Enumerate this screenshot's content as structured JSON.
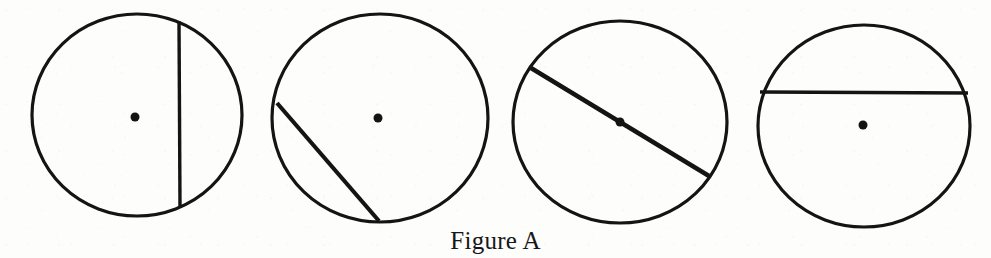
{
  "figure": {
    "caption": "Figure A",
    "background_color": "#fdfdfc",
    "ink_color": "#141414",
    "width": 991,
    "height": 258
  },
  "diagram_data": {
    "type": "geometry-diagram",
    "description": "Four circles, each with a marked center point and one straight segment drawn across it; only the third segment passes through the center (a diameter).",
    "shapes": [
      {
        "id": "circle-1",
        "label": "Circle 1",
        "center": {
          "x": 137,
          "y": 115
        },
        "center_dot": {
          "x": 135,
          "y": 117,
          "r": 4.5
        },
        "radius_x": 105,
        "radius_y": 101,
        "segment": {
          "name": "chord",
          "passes_through_center": false,
          "orientation": "vertical",
          "x1": 179,
          "y1": 21,
          "x2": 180,
          "y2": 207
        }
      },
      {
        "id": "circle-2",
        "label": "Circle 2",
        "center": {
          "x": 380,
          "y": 118
        },
        "center_dot": {
          "x": 378,
          "y": 118,
          "r": 4.5
        },
        "radius_x": 108,
        "radius_y": 104,
        "segment": {
          "name": "chord",
          "passes_through_center": false,
          "orientation": "diagonal-down-right",
          "x1": 277,
          "y1": 103,
          "x2": 379,
          "y2": 221
        }
      },
      {
        "id": "circle-3",
        "label": "Circle 3",
        "center": {
          "x": 620,
          "y": 122
        },
        "center_dot": {
          "x": 620,
          "y": 122,
          "r": 4.5
        },
        "radius_x": 107,
        "radius_y": 101,
        "segment": {
          "name": "diameter",
          "passes_through_center": true,
          "orientation": "diagonal-down-right",
          "x1": 531,
          "y1": 68,
          "x2": 709,
          "y2": 176
        }
      },
      {
        "id": "circle-4",
        "label": "Circle 4",
        "center": {
          "x": 864,
          "y": 126
        },
        "center_dot": {
          "x": 863,
          "y": 125,
          "r": 4.5
        },
        "radius_x": 106,
        "radius_y": 101,
        "segment": {
          "name": "chord",
          "passes_through_center": false,
          "orientation": "horizontal",
          "x1": 760,
          "y1": 92,
          "x2": 968,
          "y2": 93
        }
      }
    ]
  }
}
